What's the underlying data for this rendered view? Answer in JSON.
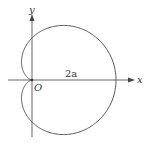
{
  "figure": {
    "type": "cardioid",
    "equation": "r = a(1 + cos θ)",
    "colors": {
      "stroke": "#555555",
      "text": "#333333",
      "background": "#ffffff"
    },
    "labels": {
      "x_axis": "x",
      "y_axis": "y",
      "origin": "O",
      "extent": "2a"
    },
    "geometry": {
      "origin_px": [
        32,
        80
      ],
      "a_px": 42
    }
  }
}
